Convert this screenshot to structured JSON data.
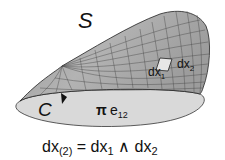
{
  "figure": {
    "surface_label": "S",
    "boundary_label": "C",
    "bivector_coeff": "π",
    "bivector_basis": "e",
    "bivector_sub": "12",
    "element_label_1": "dx",
    "element_sub_1": "1",
    "element_label_2": "dx",
    "element_sub_2": "2",
    "equation": {
      "lhs": "dx",
      "lhs_sub": "(2)",
      "equals": " = ",
      "term1": "dx",
      "term1_sub": "1",
      "wedge": " ∧ ",
      "term2": "dx",
      "term2_sub": "2"
    },
    "colors": {
      "surface_fill": "#a8a8a8",
      "disk_fill": "#d9d9d9",
      "grid_line": "#444444",
      "element_fill": "#e6e6e6"
    }
  }
}
